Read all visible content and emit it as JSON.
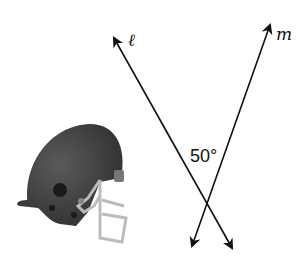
{
  "diagram": {
    "lines": [
      {
        "name": "ℓ",
        "from": [
          114,
          38
        ],
        "to": [
          232,
          248
        ]
      },
      {
        "name": "m",
        "from": [
          270,
          25
        ],
        "to": [
          192,
          246
        ]
      }
    ],
    "angle_label": "50°",
    "line_labels": {
      "l": "ℓ",
      "m": "m"
    },
    "image": "football-helmet"
  }
}
